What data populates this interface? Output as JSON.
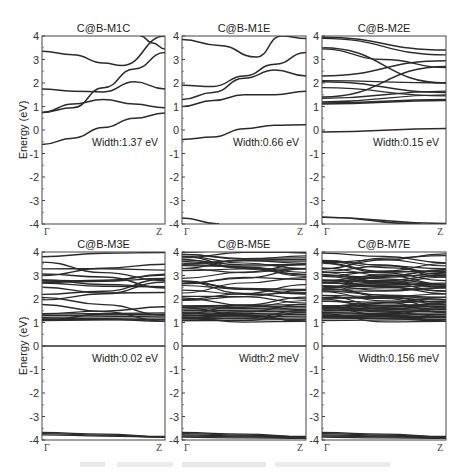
{
  "chart_data": [
    {
      "type": "line",
      "title": "C@B-M1C",
      "xlabel": "",
      "ylabel": "Energy (eV)",
      "xticks": [
        "Γ",
        "Z"
      ],
      "ylim": [
        -4,
        4
      ],
      "yticks": [
        -4,
        -3,
        -2,
        -1,
        0,
        1,
        2,
        3,
        4
      ],
      "annotation": "Width:1.37 eV",
      "series": [
        {
          "name": "band1",
          "x": [
            0,
            0.25,
            0.5,
            0.75,
            1
          ],
          "values": [
            -0.62,
            -0.35,
            0.1,
            0.5,
            0.72
          ]
        },
        {
          "name": "band2",
          "x": [
            0,
            0.25,
            0.5,
            0.75,
            1
          ],
          "values": [
            0.75,
            0.95,
            1.8,
            2.6,
            3.3
          ]
        },
        {
          "name": "band3",
          "x": [
            0,
            0.25,
            0.5,
            0.75,
            1
          ],
          "values": [
            0.75,
            1.1,
            1.3,
            1.1,
            0.95
          ]
        },
        {
          "name": "band4",
          "x": [
            0,
            0.25,
            0.5,
            0.75,
            1
          ],
          "values": [
            1.75,
            1.65,
            1.62,
            2.05,
            1.75
          ]
        },
        {
          "name": "band5",
          "x": [
            0,
            0.25,
            0.5,
            0.65,
            1
          ],
          "values": [
            3.35,
            3.2,
            2.85,
            2.75,
            4.0
          ]
        },
        {
          "name": "band6",
          "x": [
            0.8,
            0.9,
            1
          ],
          "values": [
            4.0,
            3.7,
            3.45
          ]
        }
      ]
    },
    {
      "type": "line",
      "title": "C@B-M1E",
      "xticks": [
        "Γ",
        "Z"
      ],
      "ylim": [
        -4,
        4
      ],
      "annotation": "Width:0.66 eV",
      "series": [
        {
          "name": "band1",
          "x": [
            0,
            0.25,
            0.5,
            0.75,
            1
          ],
          "values": [
            -0.4,
            -0.3,
            0.05,
            0.2,
            0.22
          ]
        },
        {
          "name": "band2",
          "x": [
            0,
            0.25,
            0.5,
            0.75,
            1
          ],
          "values": [
            1.0,
            1.25,
            1.5,
            1.5,
            1.65
          ]
        },
        {
          "name": "band3",
          "x": [
            0,
            0.25,
            0.5,
            0.75,
            1
          ],
          "values": [
            1.3,
            1.6,
            2.2,
            2.55,
            2.3
          ]
        },
        {
          "name": "band4",
          "x": [
            0,
            0.25,
            0.5,
            0.75,
            1
          ],
          "values": [
            1.9,
            1.85,
            2.3,
            2.8,
            3.3
          ]
        },
        {
          "name": "band5",
          "x": [
            0,
            0.3,
            0.6,
            0.8,
            1
          ],
          "values": [
            3.85,
            3.6,
            3.1,
            4.0,
            3.9
          ]
        },
        {
          "name": "valence",
          "x": [
            0,
            0.3
          ],
          "values": [
            -3.75,
            -4.0
          ]
        }
      ]
    },
    {
      "type": "line",
      "title": "C@B-M2E",
      "xticks": [
        "Γ",
        "Z"
      ],
      "ylim": [
        -4,
        4
      ],
      "annotation": "Width:0.15 eV",
      "series": [
        {
          "name": "band1",
          "x": [
            0,
            1
          ],
          "values": [
            -0.08,
            0.07
          ]
        },
        {
          "name": "band_cluster_1.1_1.3",
          "x": [
            0,
            1
          ],
          "values": [
            1.1,
            1.25
          ]
        },
        {
          "name": "band_cluster_1.4_2.7",
          "x": [
            0,
            1
          ],
          "values": [
            1.4,
            2.7
          ]
        },
        {
          "name": "band_cluster_2.0_1.6",
          "x": [
            0,
            1
          ],
          "values": [
            2.05,
            1.6
          ]
        },
        {
          "name": "band_2.3_3.0",
          "x": [
            0,
            1
          ],
          "values": [
            2.3,
            2.95
          ]
        },
        {
          "name": "band_3.5_2.0",
          "x": [
            0,
            1
          ],
          "values": [
            3.5,
            2.0
          ]
        },
        {
          "name": "band_3.95_3.4",
          "x": [
            0,
            1
          ],
          "values": [
            3.95,
            3.4
          ]
        },
        {
          "name": "valence",
          "x": [
            0,
            0.8
          ],
          "values": [
            -3.7,
            -4.0
          ]
        }
      ]
    },
    {
      "type": "line",
      "title": "C@B-M3E",
      "ylabel": "Energy (eV)",
      "xticks": [
        "Γ",
        "Z"
      ],
      "ylim": [
        -4,
        4
      ],
      "annotation": "Width:0.02 eV",
      "series": [
        {
          "name": "flat_band",
          "x": [
            0,
            1
          ],
          "values": [
            0.0,
            0.0
          ]
        },
        {
          "name": "conduction_cluster",
          "x": [
            0,
            1
          ],
          "values": [
            1.1,
            4.0
          ]
        },
        {
          "name": "valence",
          "x": [
            0,
            1
          ],
          "values": [
            -3.7,
            -3.9
          ]
        }
      ]
    },
    {
      "type": "line",
      "title": "C@B-M5E",
      "xticks": [
        "Γ",
        "Z"
      ],
      "ylim": [
        -4,
        4
      ],
      "annotation": "Width:2 meV",
      "series": [
        {
          "name": "flat_band",
          "x": [
            0,
            1
          ],
          "values": [
            0.0,
            0.0
          ]
        },
        {
          "name": "conduction_cluster",
          "x": [
            0,
            1
          ],
          "values": [
            1.1,
            4.0
          ]
        },
        {
          "name": "valence",
          "x": [
            0,
            1
          ],
          "values": [
            -3.7,
            -3.95
          ]
        }
      ]
    },
    {
      "type": "line",
      "title": "C@B-M7E",
      "xticks": [
        "Γ",
        "Z"
      ],
      "ylim": [
        -4,
        4
      ],
      "annotation": "Width:0.156 meV",
      "series": [
        {
          "name": "flat_band",
          "x": [
            0,
            1
          ],
          "values": [
            0.0,
            0.0
          ]
        },
        {
          "name": "conduction_cluster",
          "x": [
            0,
            1
          ],
          "values": [
            1.0,
            4.0
          ]
        },
        {
          "name": "valence",
          "x": [
            0,
            1
          ],
          "values": [
            -3.7,
            -3.95
          ]
        }
      ]
    }
  ],
  "axis": {
    "ylabel": "Energy (eV)",
    "gamma": "Γ",
    "z": "Z",
    "ticks": [
      "4",
      "3",
      "2",
      "1",
      "0",
      "-1",
      "-2",
      "-3",
      "-4"
    ]
  },
  "panels": [
    {
      "title": "C@B-M1C",
      "width_label": "Width:1.37 eV"
    },
    {
      "title": "C@B-M1E",
      "width_label": "Width:0.66 eV"
    },
    {
      "title": "C@B-M2E",
      "width_label": "Width:0.15 eV"
    },
    {
      "title": "C@B-M3E",
      "width_label": "Width:0.02 eV"
    },
    {
      "title": "C@B-M5E",
      "width_label": "Width:2 meV"
    },
    {
      "title": "C@B-M7E",
      "width_label": "Width:0.156 meV"
    }
  ]
}
